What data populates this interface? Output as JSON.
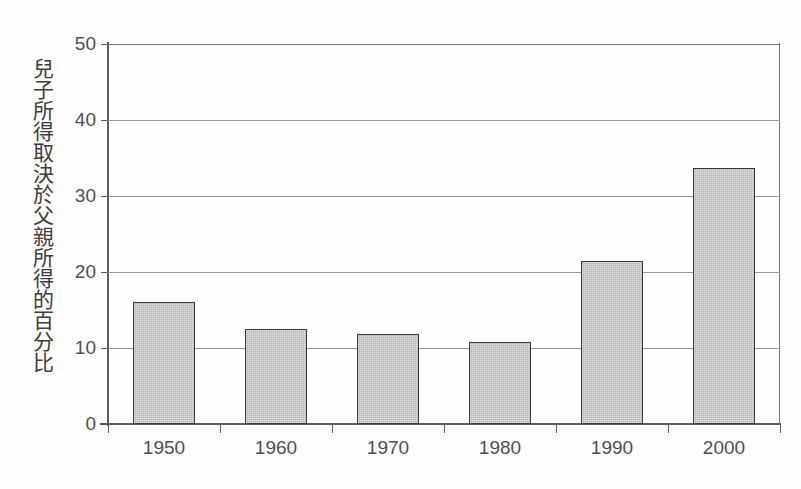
{
  "chart_data": {
    "type": "bar",
    "title": "",
    "xlabel": "",
    "ylabel": "兒子所得取決於父親所得的百分比",
    "categories": [
      "1950",
      "1960",
      "1970",
      "1980",
      "1990",
      "2000"
    ],
    "values": [
      16.0,
      12.5,
      11.9,
      10.8,
      21.4,
      33.7
    ],
    "ylim": [
      0,
      50
    ],
    "yticks": [
      "0",
      "10",
      "20",
      "30",
      "40",
      "50"
    ],
    "ytick_values": [
      0,
      10,
      20,
      30,
      40,
      50
    ],
    "grid": true,
    "legend": "none",
    "bar_fill_color": "#c3c3c3",
    "bar_edge_color": "#3a3a3a",
    "gridline_color": "#9a9a9a",
    "axis_color": "#5c5c5c",
    "background_color": "#ffffff"
  }
}
